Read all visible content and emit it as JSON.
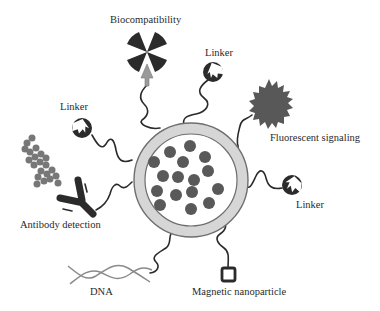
{
  "diagram": {
    "colors": {
      "dark": "#2b2b2b",
      "particle": "#595959",
      "ring": "#d6d6d6",
      "ring_border": "#6e6e6e",
      "fluorescent": "#585858",
      "protein": "#777777",
      "arrow": "#9a9a9a",
      "line": "#2a2a2a"
    },
    "labels": {
      "biocompatibility": "Biocompatibility",
      "linker_top": "Linker",
      "linker_left": "Linker",
      "linker_right": "Linker",
      "fluorescent": "Fluorescent signaling",
      "antibody": "Antibody detection",
      "dna": "DNA",
      "magnetic": "Magnetic nanoparticle"
    },
    "core": {
      "particle_count": 17
    }
  }
}
